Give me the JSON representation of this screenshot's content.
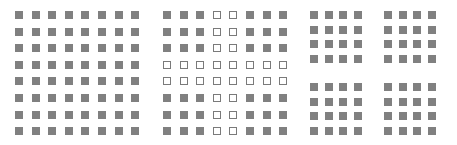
{
  "colors": {
    "filled": "#808080",
    "hollow_border": "#7a7a7a",
    "background": "#ffffff"
  },
  "panels": [
    {
      "name": "uniform-grid",
      "origin": [
        15,
        11
      ],
      "step": [
        16.6,
        16.6
      ],
      "rows": [
        "FFFFFFFF",
        "FFFFFFFF",
        "FFFFFFFF",
        "FFFFFFFF",
        "FFFFFFFF",
        "FFFFFFFF",
        "FFFFFFFF",
        "FFFFFFFF"
      ]
    },
    {
      "name": "cross-grid",
      "origin": [
        163,
        11
      ],
      "step": [
        16.6,
        16.6
      ],
      "rows": [
        "FFFHHFFF",
        "FFFHHFFF",
        "FFFHHFFF",
        "HHHHHHHH",
        "HHHHHHHH",
        "FFFHHFFF",
        "FFFHHFFF",
        "FFFHHFFF"
      ]
    },
    {
      "name": "quad-grid-top-left",
      "origin": [
        310,
        11
      ],
      "step": [
        14.7,
        14.7
      ],
      "rows": [
        "FFFF",
        "FFFF",
        "FFFF",
        "FFFF"
      ]
    },
    {
      "name": "quad-grid-top-right",
      "origin": [
        384,
        11
      ],
      "step": [
        14.7,
        14.7
      ],
      "rows": [
        "FFFF",
        "FFFF",
        "FFFF",
        "FFFF"
      ]
    },
    {
      "name": "quad-grid-bottom-left",
      "origin": [
        310,
        83
      ],
      "step": [
        14.7,
        14.7
      ],
      "rows": [
        "FFFF",
        "FFFF",
        "FFFF",
        "FFFF"
      ]
    },
    {
      "name": "quad-grid-bottom-right",
      "origin": [
        384,
        83
      ],
      "step": [
        14.7,
        14.7
      ],
      "rows": [
        "FFFF",
        "FFFF",
        "FFFF",
        "FFFF"
      ]
    }
  ]
}
